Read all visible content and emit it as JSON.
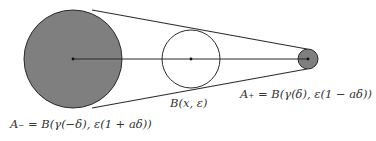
{
  "diagram": {
    "type": "geometric-construction",
    "colors": {
      "stroke": "#2a2a2a",
      "filled_disk": "#7f7f7f",
      "background": "#ffffff"
    },
    "circles": [
      {
        "id": "A_minus",
        "cx": 73,
        "cy": 59,
        "r": 49,
        "filled": true
      },
      {
        "id": "B_x_eps",
        "cx": 191,
        "cy": 59,
        "r": 29,
        "filled": false
      },
      {
        "id": "A_plus",
        "cx": 308,
        "cy": 59,
        "r": 10,
        "filled": true
      }
    ],
    "axis_segment": {
      "x1": 73,
      "y1": 59,
      "x2": 308,
      "y2": 59
    },
    "tangent_lines": [
      {
        "x1": 92,
        "y1": 10,
        "x2": 307,
        "y2": 49
      },
      {
        "x1": 92,
        "y1": 108,
        "x2": 307,
        "y2": 69
      }
    ],
    "labels": {
      "a_minus": "A₋ = B(γ(−δ), ε(1 + aδ))",
      "b_center": "B(x, ε)",
      "a_plus": "A₊ = B(γ(δ), ε(1 − aδ))"
    }
  }
}
